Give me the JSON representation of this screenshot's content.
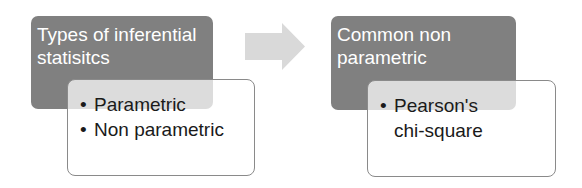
{
  "diagram": {
    "steps": [
      {
        "title": "Types of inferential statisitcs",
        "items": [
          "Parametric",
          "Non parametric"
        ]
      },
      {
        "title": "Common non parametric",
        "items": [
          "Pearson's chi-square"
        ]
      }
    ],
    "bullet_char": "•",
    "arrow_icon": "right-arrow-icon",
    "colors": {
      "title_box": "#808080",
      "title_text": "#ffffff",
      "detail_border": "#8a8a8a",
      "arrow": "#d9d9d9"
    }
  }
}
